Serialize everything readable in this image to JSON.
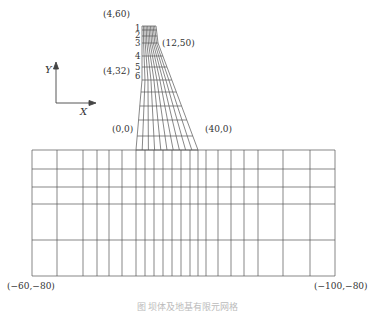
{
  "diagram": {
    "type": "finite-element mesh of dam and foundation",
    "axes": {
      "x_label": "X",
      "y_label": "Y"
    },
    "point_labels": [
      {
        "id": "crest-upstream",
        "text": "(4,60)",
        "x": 103,
        "y": 10
      },
      {
        "id": "crest-downstream-break",
        "text": "(12,50)",
        "x": 162,
        "y": 39
      },
      {
        "id": "upstream-break",
        "text": "(4,32)",
        "x": 103,
        "y": 67
      },
      {
        "id": "heel",
        "text": "(0,0)",
        "x": 112,
        "y": 125
      },
      {
        "id": "toe",
        "text": "(40,0)",
        "x": 205,
        "y": 125
      },
      {
        "id": "foundation-left-bottom",
        "text": "(−60,−80)",
        "x": 7,
        "y": 282
      },
      {
        "id": "foundation-right-bottom",
        "text": "(−100,−80)",
        "x": 314,
        "y": 282
      }
    ],
    "layer_numbers": [
      {
        "text": "1",
        "y": 24
      },
      {
        "text": "2",
        "y": 31
      },
      {
        "text": "3",
        "y": 39
      },
      {
        "text": "4",
        "y": 52
      },
      {
        "text": "5",
        "y": 63
      },
      {
        "text": "6",
        "y": 72
      }
    ],
    "mesh": {
      "line_color": "#555555",
      "dam": {
        "top_y": 26,
        "top_left_x": 142,
        "top_right_x": 156,
        "break_y": 43,
        "break_right_x": 158,
        "base_y": 150,
        "base_left_x": 136,
        "base_right_x": 198,
        "row_ys": [
          26,
          30,
          36,
          43,
          56,
          67,
          80,
          92,
          106,
          120,
          136,
          150
        ],
        "columns": 10
      },
      "foundation": {
        "left_x": 32,
        "right_x": 335,
        "top_y": 150,
        "bottom_y": 276,
        "vertical_xs": [
          32,
          57,
          83,
          97,
          109,
          122,
          136,
          145,
          154,
          163,
          172,
          181,
          190,
          198,
          206,
          218,
          231,
          244,
          258,
          283,
          310,
          335
        ],
        "horizontal_ys": [
          150,
          169,
          187,
          204,
          240,
          276
        ]
      }
    },
    "caption": "图  坝体及地基有限元网格"
  }
}
